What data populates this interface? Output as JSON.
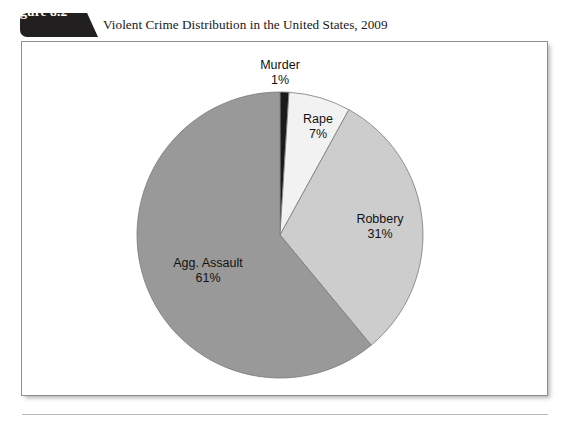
{
  "figure": {
    "number_label": "Figure 8.2",
    "title": "Violent Crime Distribution in the United States, 2009"
  },
  "colors": {
    "tab_background": "#211f20",
    "tab_text": "#ffffff",
    "title_text": "#18171a",
    "panel_border": "#8e8e8e",
    "panel_background": "#ffffff",
    "page_background": "#ffffff",
    "rule": "#b9b9b9",
    "slice_murder": "#1b1b1b",
    "slice_rape": "#f2f2f2",
    "slice_robbery": "#cdcdcd",
    "slice_agg_assault": "#999999",
    "slice_outline": "#7a7a7a",
    "label_text": "#121212"
  },
  "chart_data": {
    "type": "pie",
    "title": "Violent Crime Distribution in the United States, 2009",
    "xlabel": "",
    "ylabel": "",
    "legend": "none",
    "grid": false,
    "start_angle_deg": 0,
    "direction": "clockwise",
    "center": {
      "x": 280,
      "y": 235
    },
    "radius": 143,
    "categories": [
      "Murder",
      "Rape",
      "Robbery",
      "Agg. Assault"
    ],
    "values": [
      1,
      7,
      31,
      61
    ],
    "value_labels": [
      "1%",
      "7%",
      "31%",
      "61%"
    ],
    "slices": [
      {
        "name": "Murder",
        "value": 1,
        "value_label": "1%",
        "color": "#1b1b1b",
        "label_position": "outside-top"
      },
      {
        "name": "Rape",
        "value": 7,
        "value_label": "7%",
        "color": "#f2f2f2",
        "label_position": "inside"
      },
      {
        "name": "Robbery",
        "value": 31,
        "value_label": "31%",
        "color": "#cdcdcd",
        "label_position": "inside"
      },
      {
        "name": "Agg. Assault",
        "value": 61,
        "value_label": "61%",
        "color": "#999999",
        "label_position": "inside"
      }
    ]
  }
}
